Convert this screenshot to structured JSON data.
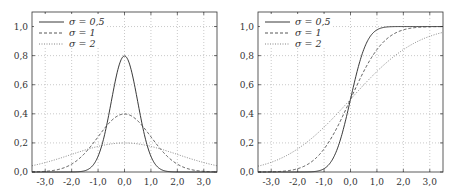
{
  "chart_data": [
    {
      "type": "line",
      "title": "Gaussian PDF",
      "xlabel": "",
      "ylabel": "",
      "xlim": [
        -3.5,
        3.5
      ],
      "ylim": [
        0.0,
        1.1
      ],
      "xticks": [
        "-3,0",
        "-2,0",
        "-1,0",
        "0,0",
        "1,0",
        "2,0",
        "3,0"
      ],
      "yticks": [
        "0,0",
        "0,2",
        "0,4",
        "0,6",
        "0,8",
        "1,0"
      ],
      "grid": true,
      "legend_position": "upper left",
      "series": [
        {
          "name": "σ = 0,5",
          "style": "solid",
          "sigma": 0.5,
          "peak": 0.8
        },
        {
          "name": "σ = 1",
          "style": "dashed",
          "sigma": 1,
          "peak": 0.4
        },
        {
          "name": "σ = 2",
          "style": "dotted",
          "sigma": 2,
          "peak": 0.2
        }
      ]
    },
    {
      "type": "line",
      "title": "Gaussian CDF",
      "xlabel": "",
      "ylabel": "",
      "xlim": [
        -3.5,
        3.5
      ],
      "ylim": [
        0.0,
        1.1
      ],
      "xticks": [
        "-3,0",
        "-2,0",
        "-1,0",
        "0,0",
        "1,0",
        "2,0",
        "3,0"
      ],
      "yticks": [
        "0,0",
        "0,2",
        "0,4",
        "0,6",
        "0,8",
        "1,0"
      ],
      "grid": true,
      "legend_position": "upper left",
      "series": [
        {
          "name": "σ = 0,5",
          "style": "solid",
          "sigma": 0.5,
          "value_at_0": 0.5
        },
        {
          "name": "σ = 1",
          "style": "dashed",
          "sigma": 1,
          "value_at_0": 0.5
        },
        {
          "name": "σ = 2",
          "style": "dotted",
          "sigma": 2,
          "value_at_0": 0.5
        }
      ]
    }
  ],
  "legend": {
    "items": [
      "σ = 0,5",
      "σ = 1",
      "σ = 2"
    ]
  },
  "axes": {
    "xticks": [
      "-3,0",
      "-2,0",
      "-1,0",
      "0,0",
      "1,0",
      "2,0",
      "3,0"
    ],
    "yticks": [
      "0,0",
      "0,2",
      "0,4",
      "0,6",
      "0,8",
      "1,0"
    ]
  }
}
